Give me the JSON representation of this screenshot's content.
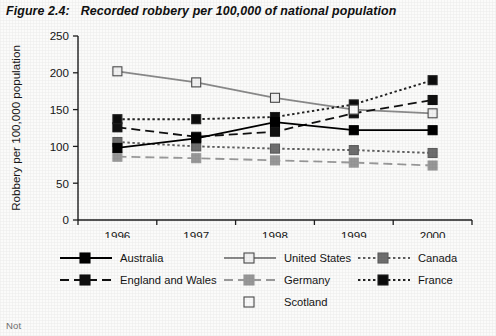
{
  "title": {
    "figure_label": "Figure 2.4:",
    "text": "Recorded robbery per 100,000 of national population"
  },
  "footnote": "Not",
  "axes": {
    "y_axis_label": "Robbery per 100,000 population",
    "y_ticks": [
      "0",
      "50",
      "100",
      "150",
      "200",
      "250"
    ],
    "x_ticks": [
      "1996",
      "1997",
      "1998",
      "1999",
      "2000"
    ]
  },
  "legend": {
    "entries": [
      {
        "label": "Australia",
        "marker": "filled-black-square",
        "line": "solid",
        "color": "#000000",
        "fill": "#000000"
      },
      {
        "label": "United States",
        "marker": "open-white-square",
        "line": "solid",
        "color": "#8a8a8a",
        "fill": "#f2f2f2"
      },
      {
        "label": "Canada",
        "marker": "filled-gray-square",
        "line": "dotted",
        "color": "#5d5d5d",
        "fill": "#6f6f6f"
      },
      {
        "label": "England and Wales",
        "marker": "filled-black-square",
        "line": "dashed",
        "color": "#111111",
        "fill": "#111111"
      },
      {
        "label": "Germany",
        "marker": "filled-gray-square",
        "line": "dashed",
        "color": "#9a9a9a",
        "fill": "#989898"
      },
      {
        "label": "France",
        "marker": "filled-black-square",
        "line": "dotted",
        "color": "#222222",
        "fill": "#0d0d0d"
      },
      {
        "label": "Scotland",
        "marker": "open-white-square",
        "line": "none",
        "color": "#6b6b6b",
        "fill": "#fafafa"
      }
    ]
  },
  "chart_data": {
    "type": "line",
    "title": "Recorded robbery per 100,000 of national population",
    "xlabel": "",
    "ylabel": "Robbery per 100,000 population",
    "categories": [
      "1996",
      "1997",
      "1998",
      "1999",
      "2000"
    ],
    "ylim": [
      0,
      250
    ],
    "ytick_step": 50,
    "grid": false,
    "legend_position": "bottom",
    "series": [
      {
        "name": "United States",
        "values": [
          202,
          187,
          166,
          150,
          145
        ]
      },
      {
        "name": "France",
        "values": [
          137,
          137,
          140,
          157,
          190
        ]
      },
      {
        "name": "England and Wales",
        "values": [
          126,
          113,
          120,
          145,
          163
        ]
      },
      {
        "name": "Australia",
        "values": [
          98,
          111,
          133,
          122,
          122
        ]
      },
      {
        "name": "Canada",
        "values": [
          106,
          100,
          97,
          95,
          91
        ]
      },
      {
        "name": "Germany",
        "values": [
          86,
          84,
          81,
          78,
          74
        ]
      },
      {
        "name": "Scotland",
        "values": [
          null,
          null,
          null,
          150,
          null
        ]
      }
    ]
  }
}
